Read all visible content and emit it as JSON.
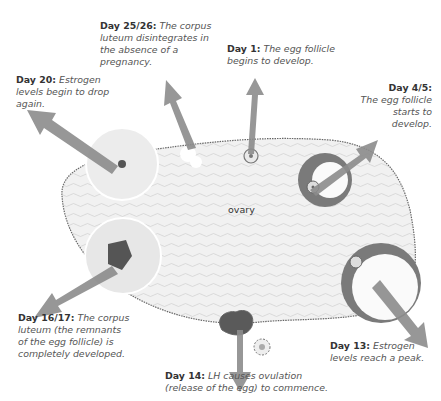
{
  "diagram": {
    "center_label": "ovary",
    "stages": [
      {
        "day": "Day 1:",
        "text": "The egg follicle begins to develop."
      },
      {
        "day": "Day 4/5:",
        "text": "The egg follicle starts to develop."
      },
      {
        "day": "Day 13:",
        "text": "Estrogen levels reach a peak."
      },
      {
        "day": "Day 14:",
        "text": "LH causes ovulation (release of the egg) to commence."
      },
      {
        "day": "Day 16/17:",
        "text": "The corpus luteum (the remnants of the egg follicle) is completely developed."
      },
      {
        "day": "Day 20:",
        "text": "Estrogen levels begin to drop again."
      },
      {
        "day": "Day 25/26:",
        "text": "The corpus luteum disintegrates in the absence of a pregnancy."
      }
    ]
  }
}
